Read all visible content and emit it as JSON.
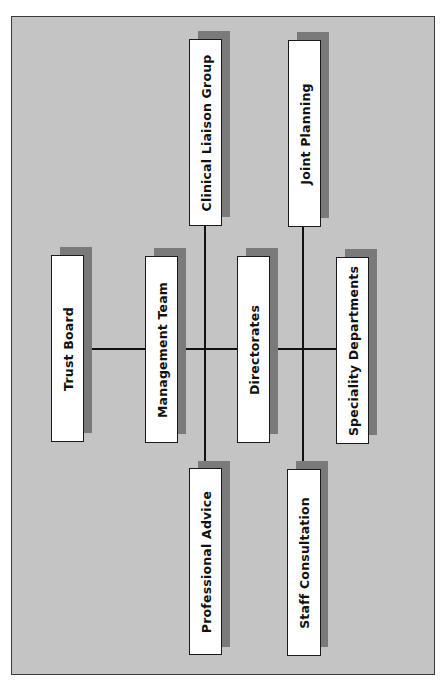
{
  "diagram": {
    "type": "organizational-structure",
    "orientation": "rotated-90-ccw",
    "colors": {
      "frame_background": "#c4c4c4",
      "frame_border": "#3a3a3a",
      "node_fill": "#ffffff",
      "node_shadow": "#7a7a7a",
      "connector": "#111111"
    },
    "nodes": [
      {
        "id": "trust-board",
        "label": "Trust Board"
      },
      {
        "id": "management-team",
        "label": "Management Team"
      },
      {
        "id": "directorates",
        "label": "Directorates"
      },
      {
        "id": "speciality-departments",
        "label": "Speciality Departments"
      },
      {
        "id": "clinical-liaison-group",
        "label": "Clinical Liaison Group"
      },
      {
        "id": "joint-planning",
        "label": "Joint Planning"
      },
      {
        "id": "professional-advice",
        "label": "Professional Advice"
      },
      {
        "id": "staff-consultation",
        "label": "Staff Consultation"
      }
    ],
    "edges": [
      {
        "from": "trust-board",
        "to": "management-team"
      },
      {
        "from": "management-team",
        "to": "directorates"
      },
      {
        "from": "directorates",
        "to": "speciality-departments"
      },
      {
        "from": "clinical-liaison-group",
        "to": "professional-advice",
        "crosses": "management-directorates-link"
      },
      {
        "from": "joint-planning",
        "to": "staff-consultation",
        "crosses": "directorates-speciality-link"
      }
    ]
  }
}
